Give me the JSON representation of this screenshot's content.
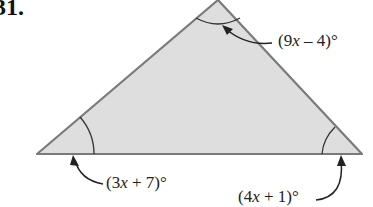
{
  "problem": {
    "number": "31."
  },
  "triangle": {
    "fill": "#dedede",
    "stroke": "#7a7a7a",
    "vertices": {
      "apex": [
        218,
        0
      ],
      "left": [
        37,
        154
      ],
      "right": [
        362,
        154
      ]
    }
  },
  "angles": {
    "top": {
      "label_pre": "(9",
      "var": "x",
      "label_post": " – 4)°"
    },
    "left": {
      "label_pre": "(3",
      "var": "x",
      "label_post": " + 7)°"
    },
    "right": {
      "label_pre": "(4",
      "var": "x",
      "label_post": " + 1)°"
    }
  }
}
